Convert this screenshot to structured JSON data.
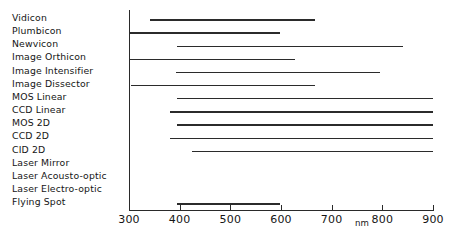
{
  "chart_data": {
    "type": "bar",
    "orientation": "horizontal",
    "title": "",
    "xlabel": "nm",
    "ylabel": "",
    "xlim": [
      300,
      900
    ],
    "grid": false,
    "legend": null,
    "xticks": [
      300,
      400,
      500,
      600,
      700,
      800,
      900
    ],
    "xtick_labels": [
      "300",
      "400",
      "500",
      "600",
      "700",
      "800",
      "900"
    ],
    "unit": "nm",
    "categories": [
      "Vidicon",
      "Plumbicon",
      "Newvicon",
      "Image Orthicon",
      "Image Intensifier",
      "Image Dissector",
      "MOS Linear",
      "CCD Linear",
      "MOS 2D",
      "CCD 2D",
      "CID 2D",
      "Laser Mirror",
      "Laser Acousto-optic",
      "Laser Electro-optic",
      "Flying Spot"
    ],
    "ranges": [
      {
        "label": "Vidicon",
        "start": 341,
        "end": 667
      },
      {
        "label": "Plumbicon",
        "start": 302,
        "end": 598
      },
      {
        "label": "Newvicon",
        "start": 395,
        "end": 841
      },
      {
        "label": "Image Orthicon",
        "start": 302,
        "end": 628
      },
      {
        "label": "Image Intensifier",
        "start": 393,
        "end": 795
      },
      {
        "label": "Image Dissector",
        "start": 304,
        "end": 667
      },
      {
        "label": "MOS Linear",
        "start": 395,
        "end": 900
      },
      {
        "label": "CCD Linear",
        "start": 381,
        "end": 900
      },
      {
        "label": "MOS 2D",
        "start": 395,
        "end": 900
      },
      {
        "label": "CCD 2D",
        "start": 381,
        "end": 900
      },
      {
        "label": "CID 2D",
        "start": 424,
        "end": 900
      },
      {
        "label": "Laser Mirror",
        "start": null,
        "end": null
      },
      {
        "label": "Laser Acousto-optic",
        "start": null,
        "end": null
      },
      {
        "label": "Laser Electro-optic",
        "start": null,
        "end": null
      },
      {
        "label": "Flying Spot",
        "start": 395,
        "end": 598
      }
    ]
  },
  "colors": {
    "bar": "#2b2b2b",
    "axis": "#2a2a2a",
    "text": "#151515",
    "background": "#ffffff"
  }
}
